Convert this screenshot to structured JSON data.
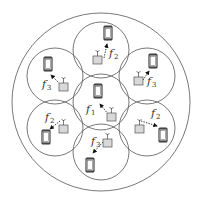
{
  "diagram": {
    "title": "",
    "outer_circle": {
      "cx": 101,
      "cy": 102,
      "r": 89
    },
    "cells": [
      {
        "id": "center",
        "cx": 101,
        "cy": 102,
        "r": 28,
        "phone": {
          "x": 94,
          "y": 84
        },
        "bs": {
          "x": 107,
          "y": 113
        },
        "arrow_from": [
          108,
          114
        ],
        "arrow_to": [
          100,
          104
        ],
        "label": {
          "base": "f",
          "sub": "1",
          "x": 86,
          "y": 113
        }
      },
      {
        "id": "top",
        "cx": 101,
        "cy": 50,
        "r": 28,
        "phone": {
          "x": 104,
          "y": 26
        },
        "bs": {
          "x": 93,
          "y": 56
        },
        "arrow_from": [
          104,
          58
        ],
        "arrow_to": [
          107,
          44
        ],
        "label": {
          "base": "f",
          "sub": "2",
          "x": 109,
          "y": 57
        }
      },
      {
        "id": "upper-left",
        "cx": 55,
        "cy": 76,
        "r": 28,
        "phone": {
          "x": 44,
          "y": 57
        },
        "bs": {
          "x": 59,
          "y": 83
        },
        "arrow_from": [
          60,
          84
        ],
        "arrow_to": [
          51,
          75
        ],
        "label": {
          "base": "f",
          "sub": "3",
          "x": 42,
          "y": 88
        }
      },
      {
        "id": "upper-right",
        "cx": 147,
        "cy": 76,
        "r": 28,
        "phone": {
          "x": 149,
          "y": 54
        },
        "bs": {
          "x": 134,
          "y": 77
        },
        "arrow_from": [
          143,
          80
        ],
        "arrow_to": [
          149,
          71
        ],
        "label": {
          "base": "f",
          "sub": "3",
          "x": 147,
          "y": 85
        }
      },
      {
        "id": "lower-left",
        "cx": 55,
        "cy": 128,
        "r": 28,
        "phone": {
          "x": 42,
          "y": 130
        },
        "bs": {
          "x": 59,
          "y": 125
        },
        "arrow_from": [
          60,
          121
        ],
        "arrow_to": [
          50,
          129
        ],
        "label": {
          "base": "f",
          "sub": "2",
          "x": 45,
          "y": 121
        }
      },
      {
        "id": "lower-right",
        "cx": 147,
        "cy": 128,
        "r": 28,
        "phone": {
          "x": 159,
          "y": 128
        },
        "bs": {
          "x": 135,
          "y": 125
        },
        "arrow_from": [
          141,
          121
        ],
        "arrow_to": [
          157,
          126
        ],
        "label": {
          "base": "f",
          "sub": "2",
          "x": 151,
          "y": 117
        }
      },
      {
        "id": "bottom",
        "cx": 101,
        "cy": 152,
        "r": 28,
        "phone": {
          "x": 86,
          "y": 158
        },
        "bs": {
          "x": 103,
          "y": 139
        },
        "arrow_from": [
          103,
          142
        ],
        "arrow_to": [
          93,
          153
        ],
        "label": {
          "base": "f",
          "sub": "3",
          "x": 91,
          "y": 145
        }
      }
    ]
  },
  "icons": {
    "phone": "mobile-phone-icon",
    "base_station": "base-station-antenna-icon",
    "link": "dashed-arrow-link"
  }
}
